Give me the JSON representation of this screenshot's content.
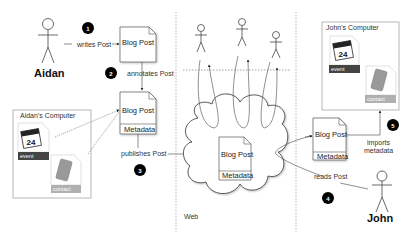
{
  "diagram": {
    "actors": {
      "aidan": "Aidan",
      "john": "John"
    },
    "steps": [
      {
        "num": "1",
        "label": "writes Post"
      },
      {
        "num": "2",
        "label": "annotates Post"
      },
      {
        "num": "3",
        "label": "publishes Post"
      },
      {
        "num": "4",
        "label": "reads Post"
      },
      {
        "num": "5",
        "label": "imports metadata",
        "label_line1": "imports",
        "label_line2": "metadata"
      }
    ],
    "documents": {
      "blog_post": "Blog Post",
      "metadata": "Metadata"
    },
    "computers": {
      "aidan": "Aidan's Computer",
      "john": "John's Computer"
    },
    "files": {
      "calendar_day": "24",
      "event": "event",
      "contact": "contact"
    },
    "web_label": "Web",
    "colors": {
      "event_tag": "#444444",
      "contact_tag": "#b0b0b0",
      "step_circle": "#000000",
      "line": "#444444"
    }
  }
}
